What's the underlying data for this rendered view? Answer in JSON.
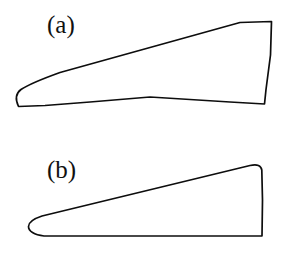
{
  "figure": {
    "background_color": "#ffffff",
    "stroke_color": "#0d0d0d",
    "width": 286,
    "height": 257,
    "panels": [
      {
        "id": "a",
        "label": "(a)",
        "shape_name": "airfoil-outline-a",
        "description": "Thin cambered airfoil / wing planform outline with rounded leading edge at left, straight upper surface rising to the right, flat top near trailing edge, and near-vertical blunt trailing edge",
        "label_position": {
          "x": 47,
          "y": 12
        }
      },
      {
        "id": "b",
        "label": "(b)",
        "shape_name": "airfoil-outline-b",
        "description": "Wedge-shaped wing planform outline with blunt rounded leading edge at left, straight upper surface rising to the right, rounded top-right corner, curved trailing edge and straight horizontal lower surface",
        "label_position": {
          "x": 47,
          "y": 27
        }
      }
    ]
  },
  "shapes": {
    "outline_a_path": "M 18.5 106.5 C 15.0 99.0 15.5 93.5 21.0 89.5 C 28.0 84.8 42.0 79.0 60.0 72.5 L 240.0 22.5 L 271.5 21.5 L 270.5 55.0 L 266.0 89.5 L 264.5 104.0 L 230.0 102.0 L 150.0 97.0 L 90.0 102.0 L 45.0 105.5 Z",
    "outline_b_path": "M 44.0 236.0 C 34.0 235.0 28.5 231.0 28.5 226.5 C 28.5 222.5 33.5 218.8 42.0 216.0 L 250.0 165.5 C 257.5 164.0 261.0 165.5 261.8 170.0 L 262.5 200.0 L 262.0 235.8 Z"
  }
}
